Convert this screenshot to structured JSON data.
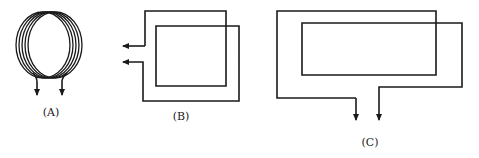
{
  "figures": [
    {
      "id": "A",
      "label": "(A)",
      "description": "circular coil with multiple turns, two leads with downward arrows"
    },
    {
      "id": "B",
      "label": "(B)",
      "description": "two-turn rectangular coil, leads exit left with leftward arrows"
    },
    {
      "id": "C",
      "label": "(C)",
      "description": "two-turn elongated rectangular coil, leads exit bottom with downward arrows"
    }
  ],
  "colors": {
    "stroke": "#1a1a1a",
    "background": "#ffffff"
  }
}
